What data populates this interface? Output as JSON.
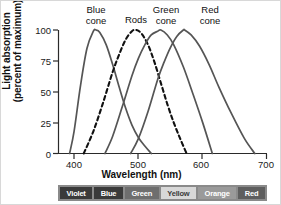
{
  "chart_data": {
    "type": "line",
    "title": "",
    "xlabel": "Wavelength (nm)",
    "ylabel_line1": "Light absorption",
    "ylabel_line2": "(percent of maximum)",
    "xlim": [
      375,
      700
    ],
    "ylim": [
      0,
      100
    ],
    "xticks": [
      400,
      500,
      600,
      700
    ],
    "yticks": [
      100,
      75,
      50,
      25,
      0
    ],
    "grid": false,
    "legend": "inline-annotations",
    "series": [
      {
        "name": "Blue cone",
        "style": "solid",
        "color": "#555555",
        "peak_x": 434,
        "annotation_line1": "Blue",
        "annotation_line2": "cone",
        "x": [
          393,
          400,
          410,
          420,
          430,
          434,
          440,
          450,
          460,
          470,
          480,
          490,
          500,
          510,
          520
        ],
        "y": [
          0,
          18,
          55,
          85,
          99,
          100,
          98,
          88,
          72,
          54,
          37,
          23,
          13,
          6,
          0
        ]
      },
      {
        "name": "Rods",
        "style": "dashed",
        "color": "#111111",
        "peak_x": 497,
        "annotation_line1": "Rods",
        "annotation_line2": "",
        "x": [
          415,
          430,
          445,
          460,
          470,
          480,
          490,
          497,
          505,
          515,
          525,
          535,
          545,
          555,
          565,
          575
        ],
        "y": [
          0,
          18,
          41,
          66,
          80,
          92,
          99,
          100,
          97,
          88,
          74,
          57,
          40,
          25,
          12,
          0
        ]
      },
      {
        "name": "Green cone",
        "style": "solid",
        "color": "#555555",
        "peak_x": 535,
        "annotation_line1": "Green",
        "annotation_line2": "cone",
        "x": [
          448,
          460,
          475,
          490,
          500,
          510,
          520,
          530,
          535,
          545,
          555,
          570,
          585,
          600,
          615
        ],
        "y": [
          0,
          14,
          38,
          63,
          77,
          88,
          96,
          99,
          100,
          96,
          88,
          70,
          48,
          25,
          0
        ]
      },
      {
        "name": "Red cone",
        "style": "solid",
        "color": "#555555",
        "peak_x": 572,
        "annotation_line1": "Red",
        "annotation_line2": "cone",
        "x": [
          488,
          500,
          515,
          530,
          540,
          550,
          560,
          570,
          572,
          582,
          595,
          610,
          625,
          645,
          665,
          681
        ],
        "y": [
          0,
          12,
          34,
          60,
          74,
          86,
          95,
          100,
          100,
          96,
          87,
          72,
          54,
          32,
          12,
          0
        ]
      }
    ]
  },
  "spectrum_bar": {
    "bands": [
      {
        "label": "Violet",
        "fill": "#3a3a3a",
        "text": "#ffffff"
      },
      {
        "label": "Blue",
        "fill": "#3a3a3a",
        "text": "#ffffff"
      },
      {
        "label": "Green",
        "fill": "#6e6e6e",
        "text": "#ffffff"
      },
      {
        "label": "Yellow",
        "fill": "#d8d8d8",
        "text": "#3a3a3a"
      },
      {
        "label": "Orange",
        "fill": "#9a9a9a",
        "text": "#ffffff"
      },
      {
        "label": "Red",
        "fill": "#5e5e5e",
        "text": "#ffffff"
      }
    ]
  }
}
